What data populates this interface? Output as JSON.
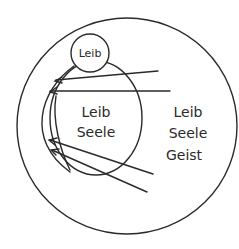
{
  "diagram": {
    "small_circle": {
      "label": "Leib"
    },
    "inner_ellipse": {
      "lines": [
        "Leib",
        "Seele"
      ]
    },
    "outer_circle": {
      "lines": [
        "Leib",
        "Seele",
        "Geist"
      ]
    },
    "arrows_count": 4,
    "stroke_color": "#2a2a2a",
    "background": "#ffffff"
  }
}
